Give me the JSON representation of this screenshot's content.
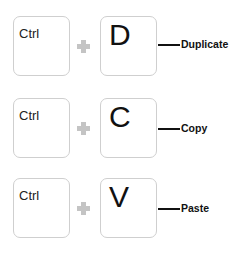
{
  "colors": {
    "key_border": "#cfcfcf",
    "plus": "#c4c4c4",
    "text": "#111111"
  },
  "shortcuts": [
    {
      "modifier": "Ctrl",
      "key": "D",
      "action": "Duplicate"
    },
    {
      "modifier": "Ctrl",
      "key": "C",
      "action": "Copy"
    },
    {
      "modifier": "Ctrl",
      "key": "V",
      "action": "Paste"
    }
  ],
  "icons": {
    "plus": "plus-icon"
  }
}
